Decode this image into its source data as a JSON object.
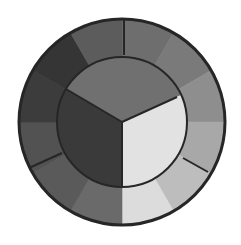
{
  "diagram": {
    "type": "color-wheel",
    "rendering": "grayscale",
    "center": [
      122,
      122
    ],
    "outer_radius": 103,
    "inner_radius": 65,
    "outline_color": "#262626",
    "outer_ring": {
      "segment_count": 12,
      "segments": [
        {
          "index": 0,
          "fill": "#6e6e6e"
        },
        {
          "index": 1,
          "fill": "#7a7a7a"
        },
        {
          "index": 2,
          "fill": "#8e8e8e"
        },
        {
          "index": 3,
          "fill": "#a8a8a8"
        },
        {
          "index": 4,
          "fill": "#bdbdbd"
        },
        {
          "index": 5,
          "fill": "#dcdcdc"
        },
        {
          "index": 6,
          "fill": "#6a6a6a"
        },
        {
          "index": 7,
          "fill": "#5a5a5a"
        },
        {
          "index": 8,
          "fill": "#525252"
        },
        {
          "index": 9,
          "fill": "#3c3c3c"
        },
        {
          "index": 10,
          "fill": "#353535"
        },
        {
          "index": 11,
          "fill": "#5c5c5c"
        }
      ],
      "dividers": [
        {
          "x1": 124,
          "y1": 19,
          "x2": 124,
          "y2": 55
        },
        {
          "x1": 183,
          "y1": 158,
          "x2": 208,
          "y2": 172
        },
        {
          "x1": 62,
          "y1": 153,
          "x2": 29,
          "y2": 168
        }
      ]
    },
    "inner_disc": {
      "sections": [
        {
          "name": "top",
          "fill": "#707070"
        },
        {
          "name": "left",
          "fill": "#3a3a3a"
        },
        {
          "name": "right",
          "fill": "#e2e2e2"
        }
      ],
      "dividers": [
        {
          "x1": 122,
          "y1": 122,
          "x2": 66,
          "y2": 89
        },
        {
          "x1": 122,
          "y1": 122,
          "x2": 177,
          "y2": 97
        },
        {
          "x1": 122,
          "y1": 122,
          "x2": 122,
          "y2": 187
        }
      ]
    }
  }
}
